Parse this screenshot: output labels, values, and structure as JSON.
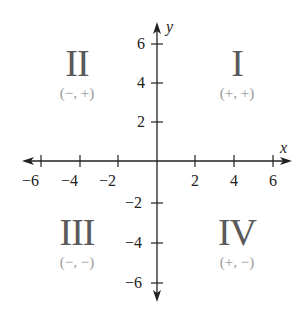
{
  "diagram": {
    "type": "cartesian-coordinate-plane",
    "axes": {
      "x": {
        "label": "x",
        "range": [
          -6,
          6
        ],
        "ticks": [
          -6,
          -4,
          -2,
          2,
          4,
          6
        ],
        "tick_labels": [
          "−6",
          "−4",
          "−2",
          "2",
          "4",
          "6"
        ]
      },
      "y": {
        "label": "y",
        "range": [
          -6,
          6
        ],
        "ticks": [
          6,
          4,
          2,
          -2,
          -4,
          -6
        ],
        "tick_labels": [
          "6",
          "4",
          "2",
          "−2",
          "−4",
          "−6"
        ]
      }
    },
    "quadrants": {
      "q1": {
        "numeral": "I",
        "signs": "(+, +)"
      },
      "q2": {
        "numeral": "II",
        "signs": "(−, +)"
      },
      "q3": {
        "numeral": "III",
        "signs": "(−, −)"
      },
      "q4": {
        "numeral": "IV",
        "signs": "(+, −)"
      }
    },
    "colors": {
      "axis": "#222222",
      "numeral": "#5a5a5a",
      "signs": "#9a9a9a"
    }
  }
}
